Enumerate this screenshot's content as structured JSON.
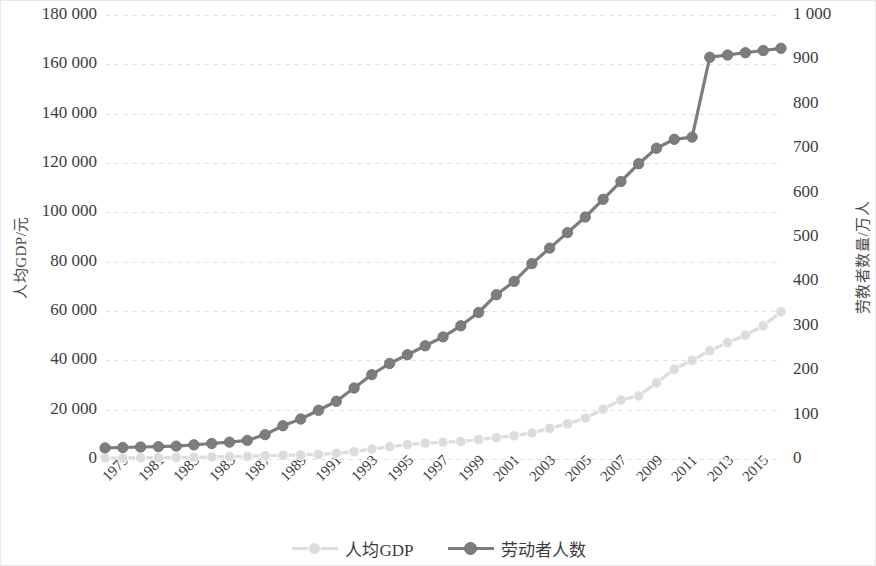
{
  "chart_data": {
    "type": "line",
    "title": "",
    "xlabel": "",
    "ylabel": "人均GDP/元",
    "y2label": "劳教者数量/万人",
    "grid": true,
    "legend_position": "bottom",
    "x": [
      1979,
      1980,
      1981,
      1982,
      1983,
      1984,
      1985,
      1986,
      1987,
      1988,
      1989,
      1990,
      1991,
      1992,
      1993,
      1994,
      1995,
      1996,
      1997,
      1998,
      1999,
      2000,
      2001,
      2002,
      2003,
      2004,
      2005,
      2006,
      2007,
      2008,
      2009,
      2010,
      2011,
      2012,
      2013,
      2014,
      2015,
      2016,
      2017
    ],
    "xtick_labels": [
      "1979",
      "1981",
      "1983",
      "1985",
      "1987",
      "1989",
      "1991",
      "1993",
      "1995",
      "1997",
      "1999",
      "2001",
      "2003",
      "2005",
      "2007",
      "2009",
      "2011",
      "2013",
      "2015"
    ],
    "ylim": [
      0,
      180000
    ],
    "yticks": [
      "0",
      "20 000",
      "40 000",
      "60 000",
      "80 000",
      "100 000",
      "120 000",
      "140 000",
      "160 000",
      "180 000"
    ],
    "y2lim": [
      0,
      1000
    ],
    "y2ticks": [
      "0",
      "100",
      "200",
      "300",
      "400",
      "500",
      "600",
      "700",
      "800",
      "900",
      "1 000"
    ],
    "series": [
      {
        "name": "人均GDP",
        "axis": "left",
        "color": "#dcdcdc",
        "marker": "circle",
        "values": [
          420,
          470,
          500,
          540,
          600,
          700,
          860,
          960,
          1110,
          1380,
          1520,
          1660,
          1900,
          2320,
          3000,
          4000,
          5000,
          5850,
          6450,
          6800,
          7100,
          7900,
          8650,
          9400,
          10600,
          12400,
          14300,
          16600,
          20200,
          23900,
          25600,
          30900,
          36400,
          40000,
          43900,
          47200,
          50200,
          54000,
          59700
        ]
      },
      {
        "name": "劳动者人数",
        "axis": "right",
        "color": "#7d7d7d",
        "marker": "circle",
        "values": [
          25,
          26,
          27,
          28,
          29,
          32,
          35,
          38,
          42,
          55,
          75,
          90,
          110,
          130,
          160,
          190,
          215,
          235,
          255,
          275,
          300,
          330,
          370,
          400,
          440,
          475,
          510,
          545,
          585,
          625,
          665,
          700,
          720,
          725,
          905,
          910,
          915,
          920,
          925
        ]
      }
    ],
    "note_axis_mapping": "light series plotted on left GDP axis, dark series on right 万人 axis"
  },
  "legend": {
    "items": [
      {
        "label": "人均GDP",
        "color": "#dcdcdc"
      },
      {
        "label": "劳动者人数",
        "color": "#7d7d7d"
      }
    ]
  }
}
